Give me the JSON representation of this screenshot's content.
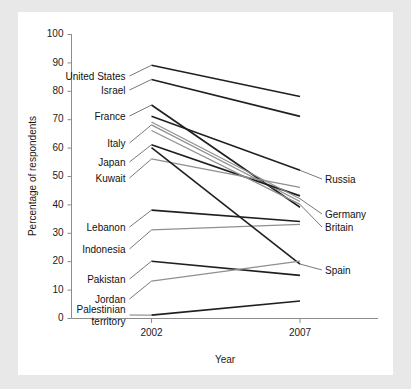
{
  "chart_data": {
    "type": "line",
    "subtype": "slopegraph",
    "title": "",
    "xlabel": "Year",
    "ylabel": "Percentage of respondents",
    "categories": [
      "2002",
      "2007"
    ],
    "x": [
      2002,
      2007
    ],
    "xlim": [
      2002,
      2007
    ],
    "ylim": [
      0,
      100
    ],
    "ytick_labels": [
      "0",
      "10",
      "20",
      "30",
      "40",
      "50",
      "60",
      "70",
      "80",
      "90",
      "100"
    ],
    "yticks": [
      0,
      10,
      20,
      30,
      40,
      50,
      60,
      70,
      80,
      90,
      100
    ],
    "xtick_labels": [
      "2002",
      "2007"
    ],
    "grid": false,
    "legend": "none (direct labels at line ends)",
    "series": [
      {
        "name": "United States",
        "values": [
          89,
          78
        ],
        "label_side": "left",
        "color": "#1f1f1f"
      },
      {
        "name": "Israel",
        "values": [
          84,
          71
        ],
        "label_side": "left",
        "color": "#1f1f1f"
      },
      {
        "name": "France",
        "values": [
          75,
          39
        ],
        "label_side": "left",
        "color": "#1f1f1f"
      },
      {
        "name": "Italy",
        "values": [
          68,
          41
        ],
        "label_side": "left",
        "color": "#8f8f8f"
      },
      {
        "name": "Japan",
        "values": [
          61,
          43
        ],
        "label_side": "left",
        "color": "#1f1f1f"
      },
      {
        "name": "Kuwait",
        "values": [
          56,
          46
        ],
        "label_side": "left",
        "color": "#8f8f8f"
      },
      {
        "name": "Russia",
        "values": [
          71,
          52
        ],
        "label_side": "right",
        "color": "#1f1f1f"
      },
      {
        "name": "Germany",
        "values": [
          69,
          42
        ],
        "label_side": "right",
        "color": "#8f8f8f"
      },
      {
        "name": "Britain",
        "values": [
          66,
          40
        ],
        "label_side": "right",
        "color": "#8f8f8f"
      },
      {
        "name": "Lebanon",
        "values": [
          38,
          34
        ],
        "label_side": "left",
        "color": "#1f1f1f"
      },
      {
        "name": "Indonesia",
        "values": [
          31,
          33
        ],
        "label_side": "left",
        "color": "#8f8f8f"
      },
      {
        "name": "Spain",
        "values": [
          60,
          19
        ],
        "label_side": "right",
        "color": "#1f1f1f"
      },
      {
        "name": "Pakistan",
        "values": [
          20,
          15
        ],
        "label_side": "left",
        "color": "#1f1f1f"
      },
      {
        "name": "Jordan",
        "values": [
          13,
          20
        ],
        "label_side": "left",
        "color": "#8f8f8f"
      },
      {
        "name": "Palestinian territory",
        "values": [
          1,
          6
        ],
        "label_side": "left",
        "color": "#1f1f1f"
      }
    ],
    "colors": {
      "line_dark": "#1f1f1f",
      "line_light": "#8f8f8f",
      "axis": "#8c8c8c",
      "text": "#111111",
      "plot_background": "#ffffff",
      "page_background": "#e8e8e8"
    }
  },
  "axis": {
    "y_title": "Percentage of respondents",
    "x_title": "Year"
  }
}
